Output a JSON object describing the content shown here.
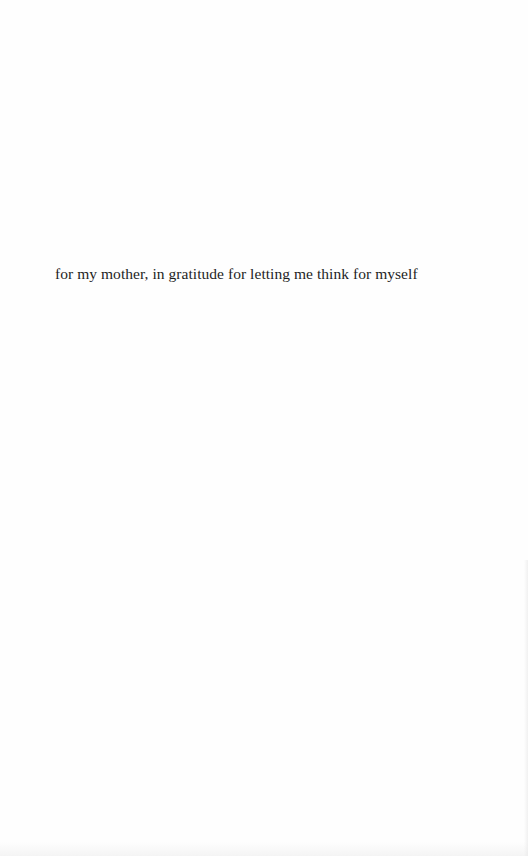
{
  "page": {
    "background_color": "#fefefe",
    "text_color": "#1e1e1e",
    "dedication": "for my mother, in gratitude for letting me think for myself"
  }
}
